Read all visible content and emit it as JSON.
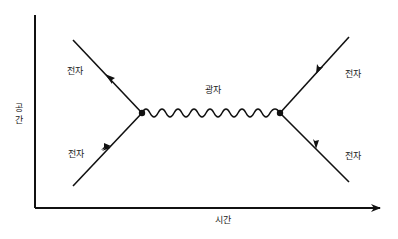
{
  "diagram": {
    "title": "",
    "axes": {
      "x_label": "시간",
      "y_label_chars": [
        "공",
        "간"
      ]
    },
    "particles": {
      "photon_label": "광자",
      "electron_in_left_label": "전자",
      "electron_out_left_label": "전자",
      "electron_in_right_label": "전자",
      "electron_out_right_label": "전자"
    },
    "colors": {
      "line": "#111111",
      "text": "#222222",
      "background": "#ffffff"
    }
  }
}
